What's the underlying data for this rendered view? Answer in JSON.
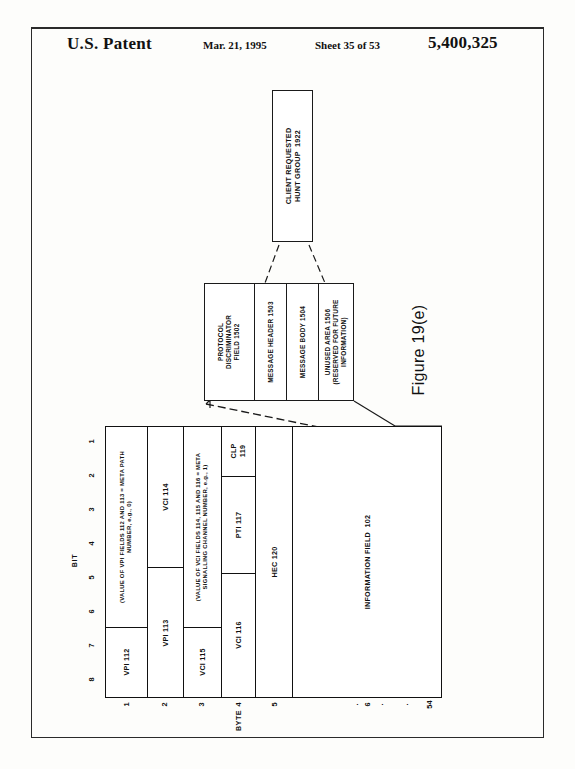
{
  "header": {
    "title": "U.S. Patent",
    "date": "Mar. 21, 1995",
    "sheet": "Sheet 35 of 53",
    "patent_number": "5,400,325"
  },
  "figure": {
    "caption": "Figure 19(e)"
  },
  "hunt_group_box": {
    "label": "CLIENT REQUESTED\nHUNT GROUP  1922"
  },
  "message_structure": {
    "segments": [
      {
        "label": "PROTOCOL\nDISCRIMINATOR\nFIELD 1502",
        "width_pct": 33.0
      },
      {
        "label": "MESSAGE HEADER 1503",
        "width_pct": 22.0
      },
      {
        "label": "MESSAGE BODY 1504",
        "width_pct": 21.5
      },
      {
        "label": "UNUSED AREA 1506\n(RESERVED FOR FUTURE\nINFORMATION)",
        "width_pct": 23.5
      }
    ]
  },
  "cell_table": {
    "bit_axis_label": "BIT",
    "bit_ticks": [
      "1",
      "2",
      "3",
      "4",
      "5",
      "6",
      "7",
      "8"
    ],
    "byte_axis_label": "BYTE",
    "byte_ticks": [
      "1",
      "2",
      "3",
      "4",
      "5",
      "6",
      ".",
      ".",
      ".",
      "54"
    ],
    "columns": [
      {
        "byte": "1",
        "width_pct": 12.2,
        "rows": [
          {
            "label": "(VALUE OF VPI FIELDS 112 AND 113 = META PATH\nNUMBER, e.g., 0)",
            "height_pct": 74.0,
            "style": "tiny"
          },
          {
            "label": "VPI 112",
            "height_pct": 26.0,
            "style": "normal"
          }
        ]
      },
      {
        "byte": "2",
        "width_pct": 10.7,
        "rows": [
          {
            "label": "VCI 114",
            "height_pct": 52.0,
            "style": "normal"
          },
          {
            "label": "VPI 113",
            "height_pct": 48.0,
            "style": "normal"
          }
        ]
      },
      {
        "byte": "3",
        "width_pct": 11.3,
        "rows": [
          {
            "label": "(VALUE OF VCI FIELDS 114, 115 AND 116 = META\nSIGNALLING CHANNEL NUMBER, e.g., 1)",
            "height_pct": 74.0,
            "style": "tiny"
          },
          {
            "label": "VCI 115",
            "height_pct": 26.0,
            "style": "normal"
          }
        ]
      },
      {
        "byte": "4",
        "width_pct": 10.4,
        "rows": [
          {
            "label": "CLP\n119",
            "height_pct": 18.0,
            "style": "normal"
          },
          {
            "label": "PTI 117",
            "height_pct": 36.0,
            "style": "normal"
          },
          {
            "label": "VCI 116",
            "height_pct": 46.0,
            "style": "normal"
          }
        ]
      },
      {
        "byte": "5",
        "width_pct": 11.0,
        "rows": [
          {
            "label": "HEC 120",
            "height_pct": 100,
            "style": "normal"
          }
        ]
      },
      {
        "byte": "6",
        "width_pct": 44.4,
        "rows": [
          {
            "label": "INFORMATION FIELD  102",
            "height_pct": 100,
            "style": "normal"
          }
        ]
      }
    ]
  },
  "colors": {
    "ink": "#111111",
    "paper": "#fdfdfb",
    "rule": "#2a2a2a"
  }
}
